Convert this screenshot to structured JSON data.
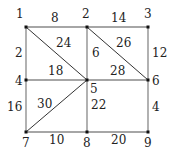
{
  "diagram": {
    "type": "weighted-graph",
    "nodes": [
      {
        "id": "1",
        "label": "1",
        "x": 26,
        "y": 27,
        "lx": 16,
        "ly": 18
      },
      {
        "id": "2",
        "label": "2",
        "x": 87,
        "y": 27,
        "lx": 82,
        "ly": 18
      },
      {
        "id": "3",
        "label": "3",
        "x": 148,
        "y": 27,
        "lx": 144,
        "ly": 18
      },
      {
        "id": "4",
        "label": "4",
        "x": 26,
        "y": 80,
        "lx": 15,
        "ly": 85
      },
      {
        "id": "5",
        "label": "5",
        "x": 87,
        "y": 80,
        "lx": 90,
        "ly": 93
      },
      {
        "id": "6",
        "label": "6",
        "x": 148,
        "y": 80,
        "lx": 152,
        "ly": 85
      },
      {
        "id": "7",
        "label": "7",
        "x": 26,
        "y": 132,
        "lx": 22,
        "ly": 147
      },
      {
        "id": "8",
        "label": "8",
        "x": 87,
        "y": 132,
        "lx": 83,
        "ly": 147
      },
      {
        "id": "9",
        "label": "9",
        "x": 148,
        "y": 132,
        "lx": 144,
        "ly": 147
      }
    ],
    "edges": [
      {
        "from": "1",
        "to": "2",
        "weight": "8",
        "wx": 51,
        "wy": 22,
        "diagonal": false
      },
      {
        "from": "2",
        "to": "3",
        "weight": "14",
        "wx": 111,
        "wy": 22,
        "diagonal": false
      },
      {
        "from": "1",
        "to": "4",
        "weight": "2",
        "wx": 15,
        "wy": 57,
        "diagonal": false
      },
      {
        "from": "2",
        "to": "5",
        "weight": "6",
        "wx": 92,
        "wy": 57,
        "diagonal": false
      },
      {
        "from": "3",
        "to": "6",
        "weight": "12",
        "wx": 152,
        "wy": 57,
        "diagonal": false
      },
      {
        "from": "1",
        "to": "5",
        "weight": "24",
        "wx": 56,
        "wy": 47,
        "diagonal": true
      },
      {
        "from": "2",
        "to": "6",
        "weight": "26",
        "wx": 116,
        "wy": 47,
        "diagonal": true
      },
      {
        "from": "4",
        "to": "5",
        "weight": "18",
        "wx": 48,
        "wy": 75,
        "diagonal": false
      },
      {
        "from": "5",
        "to": "6",
        "weight": "28",
        "wx": 110,
        "wy": 75,
        "diagonal": false
      },
      {
        "from": "4",
        "to": "7",
        "weight": "16",
        "wx": 7,
        "wy": 111,
        "diagonal": false
      },
      {
        "from": "7",
        "to": "5",
        "weight": "30",
        "wx": 37,
        "wy": 108,
        "diagonal": true
      },
      {
        "from": "5",
        "to": "8",
        "weight": "22",
        "wx": 91,
        "wy": 109,
        "diagonal": false
      },
      {
        "from": "6",
        "to": "9",
        "weight": "4",
        "wx": 152,
        "wy": 111,
        "diagonal": false
      },
      {
        "from": "7",
        "to": "8",
        "weight": "10",
        "wx": 49,
        "wy": 144,
        "diagonal": false
      },
      {
        "from": "8",
        "to": "9",
        "weight": "20",
        "wx": 111,
        "wy": 144,
        "diagonal": false
      }
    ],
    "colors": {
      "edge": "#888888",
      "diagonal": "#333333",
      "node": "#111111",
      "text": "#222222"
    }
  }
}
